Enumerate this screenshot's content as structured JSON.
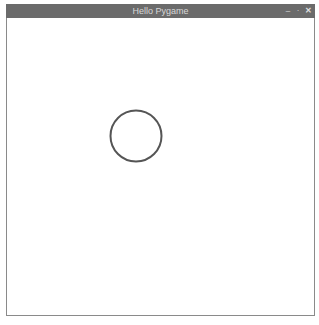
{
  "window": {
    "title": "Hello Pygame",
    "controls": {
      "minimize": "–",
      "maximize": "·",
      "close": "✕"
    }
  },
  "canvas": {
    "background": "#ffffff",
    "shapes": [
      {
        "type": "circle",
        "stroke": "#555555",
        "fill": "none"
      }
    ]
  }
}
